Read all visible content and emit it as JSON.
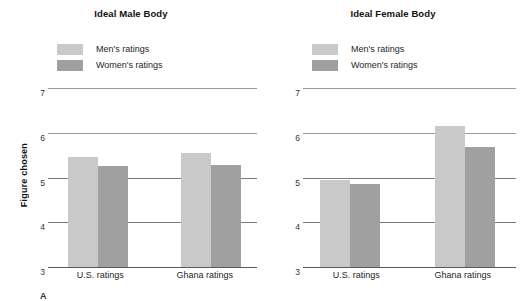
{
  "chart_data": [
    {
      "type": "bar",
      "title": "Ideal Male Body",
      "xlabel": "",
      "ylabel": "Figure chosen",
      "categories": [
        "U.S. ratings",
        "Ghana ratings"
      ],
      "series": [
        {
          "name": "Men's ratings",
          "color": "#c9c9c9",
          "values": [
            5.45,
            5.55
          ]
        },
        {
          "name": "Women's ratings",
          "color": "#a0a0a0",
          "values": [
            5.25,
            5.27
          ]
        }
      ],
      "ylim": [
        3,
        7
      ],
      "yticks": [
        3,
        4,
        5,
        6,
        7
      ],
      "grid": true,
      "legend_position": "top-left"
    },
    {
      "type": "bar",
      "title": "Ideal Female Body",
      "xlabel": "",
      "ylabel": "",
      "categories": [
        "U.S. ratings",
        "Ghana ratings"
      ],
      "series": [
        {
          "name": "Men's ratings",
          "color": "#c9c9c9",
          "values": [
            4.95,
            6.15
          ]
        },
        {
          "name": "Women's ratings",
          "color": "#a0a0a0",
          "values": [
            4.85,
            5.68
          ]
        }
      ],
      "ylim": [
        3,
        7
      ],
      "yticks": [
        3,
        4,
        5,
        6,
        7
      ],
      "grid": true,
      "legend_position": "top-left"
    }
  ],
  "panels": [
    {
      "title": "Ideal Male Body",
      "legend": [
        {
          "label": "Men's ratings",
          "color": "#c9c9c9"
        },
        {
          "label": "Women's ratings",
          "color": "#a0a0a0"
        }
      ],
      "yticks": [
        "7",
        "6",
        "5",
        "4",
        "3"
      ],
      "xlabels": [
        "U.S. ratings",
        "Ghana ratings"
      ],
      "ylabel": "Figure chosen"
    },
    {
      "title": "Ideal Female Body",
      "legend": [
        {
          "label": "Men's ratings",
          "color": "#c9c9c9"
        },
        {
          "label": "Women's ratings",
          "color": "#a0a0a0"
        }
      ],
      "yticks": [
        "7",
        "6",
        "5",
        "4",
        "3"
      ],
      "xlabels": [
        "U.S. ratings",
        "Ghana ratings"
      ],
      "ylabel": ""
    }
  ],
  "footer_mark": "A"
}
